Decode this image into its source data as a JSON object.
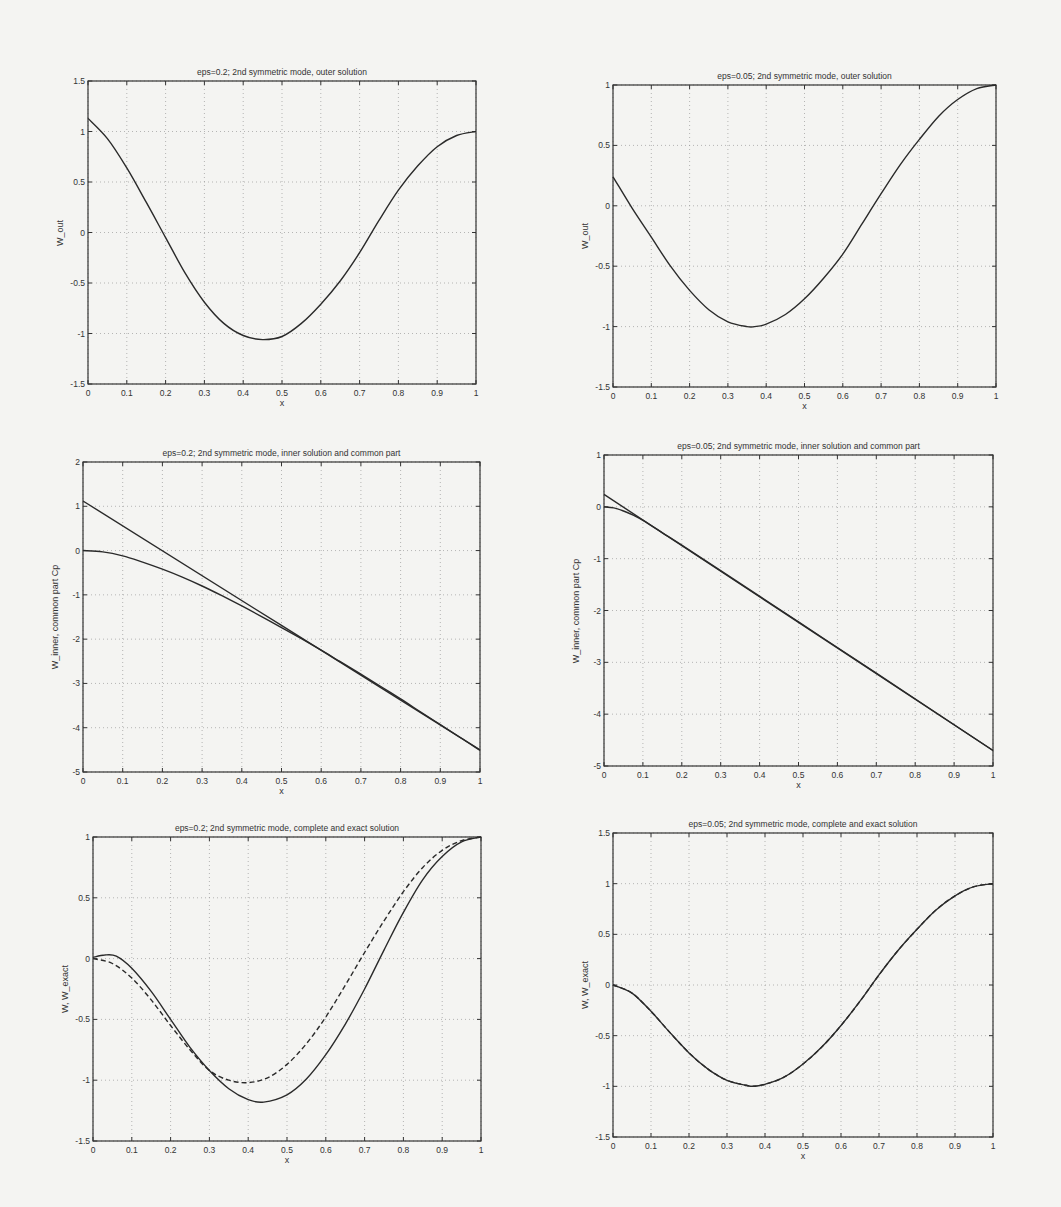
{
  "chart_data": [
    {
      "id": "p1",
      "type": "line",
      "title": "eps=0.2;  2nd symmetric mode,  outer solution",
      "xlabel": "x",
      "ylabel": "W_out",
      "xlim": [
        0,
        1
      ],
      "ylim": [
        -1.5,
        1.5
      ],
      "xticks": [
        "0",
        "0.1",
        "0.2",
        "0.3",
        "0.4",
        "0.5",
        "0.6",
        "0.7",
        "0.8",
        "0.9",
        "1"
      ],
      "yticks": [
        "-1.5",
        "-1",
        "-0.5",
        "0",
        "0.5",
        "1",
        "1.5"
      ],
      "grid": true,
      "box": {
        "left": 88,
        "right": 476,
        "top": 81,
        "bottom": 384
      },
      "series": [
        {
          "name": "W_out",
          "style": "solid",
          "x": [
            0,
            0.05,
            0.1,
            0.15,
            0.2,
            0.25,
            0.3,
            0.35,
            0.4,
            0.45,
            0.5,
            0.55,
            0.6,
            0.65,
            0.7,
            0.75,
            0.8,
            0.85,
            0.9,
            0.95,
            1.0
          ],
          "y": [
            1.13,
            0.93,
            0.64,
            0.3,
            -0.05,
            -0.4,
            -0.69,
            -0.9,
            -1.02,
            -1.06,
            -1.03,
            -0.9,
            -0.71,
            -0.48,
            -0.2,
            0.12,
            0.42,
            0.66,
            0.85,
            0.96,
            1.0
          ]
        }
      ]
    },
    {
      "id": "p2",
      "type": "line",
      "title": "eps=0.05;  2nd symmetric mode,  outer solution",
      "xlabel": "x",
      "ylabel": "W_out",
      "xlim": [
        0,
        1
      ],
      "ylim": [
        -1.5,
        1
      ],
      "xticks": [
        "0",
        "0.1",
        "0.2",
        "0.3",
        "0.4",
        "0.5",
        "0.6",
        "0.7",
        "0.8",
        "0.9",
        "1"
      ],
      "yticks": [
        "-1.5",
        "-1",
        "-0.5",
        "0",
        "0.5",
        "1"
      ],
      "grid": true,
      "box": {
        "left": 613,
        "right": 996,
        "top": 85,
        "bottom": 387
      },
      "series": [
        {
          "name": "W_out",
          "style": "solid",
          "x": [
            0,
            0.05,
            0.1,
            0.15,
            0.2,
            0.25,
            0.3,
            0.35,
            0.37,
            0.4,
            0.45,
            0.5,
            0.55,
            0.6,
            0.65,
            0.7,
            0.75,
            0.8,
            0.85,
            0.9,
            0.95,
            1.0
          ],
          "y": [
            0.24,
            -0.02,
            -0.26,
            -0.5,
            -0.7,
            -0.86,
            -0.96,
            -1.0,
            -1.0,
            -0.98,
            -0.9,
            -0.77,
            -0.6,
            -0.4,
            -0.15,
            0.1,
            0.34,
            0.55,
            0.74,
            0.88,
            0.97,
            1.0
          ]
        }
      ]
    },
    {
      "id": "p3",
      "type": "line",
      "title": "eps=0.2;  2nd symmetric mode,  inner solution and common part",
      "xlabel": "x",
      "ylabel": "W_inner, common part Cp",
      "xlim": [
        0,
        1
      ],
      "ylim": [
        -5,
        2
      ],
      "xticks": [
        "0",
        "0.1",
        "0.2",
        "0.3",
        "0.4",
        "0.5",
        "0.6",
        "0.7",
        "0.8",
        "0.9",
        "1"
      ],
      "yticks": [
        "-5",
        "-4",
        "-3",
        "-2",
        "-1",
        "0",
        "1",
        "2"
      ],
      "grid": true,
      "box": {
        "left": 83,
        "right": 480,
        "top": 462,
        "bottom": 772
      },
      "series": [
        {
          "name": "common part Cp",
          "style": "solid",
          "x": [
            0,
            1
          ],
          "y": [
            1.12,
            -4.5
          ]
        },
        {
          "name": "W_inner",
          "style": "solid",
          "x": [
            0,
            0.05,
            0.1,
            0.15,
            0.2,
            0.25,
            0.3,
            0.35,
            0.4,
            0.45,
            0.5,
            0.55,
            0.6,
            0.65,
            0.7,
            0.75,
            0.8,
            0.85,
            0.9,
            0.95,
            1.0
          ],
          "y": [
            0,
            -0.03,
            -0.12,
            -0.26,
            -0.42,
            -0.6,
            -0.8,
            -1.02,
            -1.25,
            -1.49,
            -1.74,
            -1.99,
            -2.25,
            -2.52,
            -2.79,
            -3.07,
            -3.35,
            -3.64,
            -3.93,
            -4.22,
            -4.51
          ]
        }
      ]
    },
    {
      "id": "p4",
      "type": "line",
      "title": "eps=0.05;  2nd symmetric mode,  inner solution and common part",
      "xlabel": "x",
      "ylabel": "W_inner, common part Cp",
      "xlim": [
        0,
        1
      ],
      "ylim": [
        -5,
        1
      ],
      "xticks": [
        "0",
        "0.1",
        "0.2",
        "0.3",
        "0.4",
        "0.5",
        "0.6",
        "0.7",
        "0.8",
        "0.9",
        "1"
      ],
      "yticks": [
        "-5",
        "-4",
        "-3",
        "-2",
        "-1",
        "0",
        "1"
      ],
      "grid": true,
      "box": {
        "left": 604,
        "right": 993,
        "top": 455,
        "bottom": 766
      },
      "series": [
        {
          "name": "common part Cp",
          "style": "solid",
          "x": [
            0,
            1
          ],
          "y": [
            0.24,
            -4.7
          ]
        },
        {
          "name": "W_inner",
          "style": "solid",
          "x": [
            0,
            0.025,
            0.05,
            0.075,
            0.1,
            0.15,
            0.2,
            0.3,
            0.5,
            0.7,
            1.0
          ],
          "y": [
            0,
            -0.02,
            -0.08,
            -0.16,
            -0.26,
            -0.5,
            -0.74,
            -1.23,
            -2.22,
            -3.21,
            -4.7
          ]
        }
      ]
    },
    {
      "id": "p5",
      "type": "line",
      "title": "eps=0.2;  2nd symmetric mode,  complete and exact solution",
      "xlabel": "x",
      "ylabel": "W, W_exact",
      "xlim": [
        0,
        1
      ],
      "ylim": [
        -1.5,
        1
      ],
      "xticks": [
        "0",
        "0.1",
        "0.2",
        "0.3",
        "0.4",
        "0.5",
        "0.6",
        "0.7",
        "0.8",
        "0.9",
        "1"
      ],
      "yticks": [
        "-1.5",
        "-1",
        "-0.5",
        "0",
        "0.5",
        "1"
      ],
      "grid": true,
      "box": {
        "left": 93,
        "right": 481,
        "top": 837,
        "bottom": 1141
      },
      "series": [
        {
          "name": "W (complete)",
          "style": "solid",
          "x": [
            0,
            0.03,
            0.06,
            0.1,
            0.15,
            0.2,
            0.25,
            0.3,
            0.35,
            0.4,
            0.44,
            0.5,
            0.55,
            0.6,
            0.65,
            0.7,
            0.75,
            0.8,
            0.85,
            0.9,
            0.95,
            1.0
          ],
          "y": [
            0.01,
            0.03,
            0.02,
            -0.08,
            -0.27,
            -0.5,
            -0.73,
            -0.92,
            -1.07,
            -1.16,
            -1.18,
            -1.12,
            -0.99,
            -0.79,
            -0.54,
            -0.25,
            0.07,
            0.38,
            0.65,
            0.84,
            0.96,
            1.0
          ]
        },
        {
          "name": "W_exact",
          "style": "dashed",
          "x": [
            0,
            0.05,
            0.1,
            0.15,
            0.2,
            0.25,
            0.3,
            0.35,
            0.4,
            0.45,
            0.5,
            0.55,
            0.6,
            0.65,
            0.7,
            0.75,
            0.8,
            0.85,
            0.9,
            0.95,
            1.0
          ],
          "y": [
            0,
            -0.04,
            -0.16,
            -0.34,
            -0.55,
            -0.75,
            -0.92,
            -1.0,
            -1.02,
            -0.98,
            -0.87,
            -0.7,
            -0.48,
            -0.22,
            0.05,
            0.31,
            0.55,
            0.75,
            0.89,
            0.97,
            1.0
          ]
        }
      ]
    },
    {
      "id": "p6",
      "type": "line",
      "title": "eps=0.05;  2nd symmetric mode,  complete and exact solution",
      "xlabel": "x",
      "ylabel": "W, W_exact",
      "xlim": [
        0,
        1
      ],
      "ylim": [
        -1.5,
        1.5
      ],
      "xticks": [
        "0",
        "0.1",
        "0.2",
        "0.3",
        "0.4",
        "0.5",
        "0.6",
        "0.7",
        "0.8",
        "0.9",
        "1"
      ],
      "yticks": [
        "-1.5",
        "-1",
        "-0.5",
        "0",
        "0.5",
        "1",
        "1.5"
      ],
      "grid": true,
      "box": {
        "left": 613,
        "right": 993,
        "top": 833,
        "bottom": 1137
      },
      "series": [
        {
          "name": "W (complete)",
          "style": "solid",
          "x": [
            0,
            0.05,
            0.1,
            0.15,
            0.2,
            0.25,
            0.3,
            0.35,
            0.37,
            0.4,
            0.45,
            0.5,
            0.55,
            0.6,
            0.65,
            0.7,
            0.75,
            0.8,
            0.85,
            0.9,
            0.95,
            1.0
          ],
          "y": [
            0,
            -0.08,
            -0.26,
            -0.47,
            -0.67,
            -0.83,
            -0.94,
            -0.99,
            -1.0,
            -0.98,
            -0.91,
            -0.78,
            -0.61,
            -0.4,
            -0.16,
            0.1,
            0.34,
            0.55,
            0.74,
            0.88,
            0.97,
            1.0
          ]
        },
        {
          "name": "W_exact",
          "style": "dashed",
          "x": [
            0,
            0.05,
            0.1,
            0.15,
            0.2,
            0.25,
            0.3,
            0.35,
            0.37,
            0.4,
            0.45,
            0.5,
            0.55,
            0.6,
            0.65,
            0.7,
            0.75,
            0.8,
            0.85,
            0.9,
            0.95,
            1.0
          ],
          "y": [
            0,
            -0.08,
            -0.26,
            -0.47,
            -0.67,
            -0.83,
            -0.94,
            -0.99,
            -1.0,
            -0.98,
            -0.91,
            -0.78,
            -0.61,
            -0.4,
            -0.16,
            0.1,
            0.34,
            0.55,
            0.74,
            0.88,
            0.97,
            1.0
          ]
        }
      ]
    }
  ],
  "colors": {
    "background": "#f4f4f2",
    "axes": "#333333",
    "line": "#2a2a2a",
    "grid": "#9a9a9a"
  }
}
